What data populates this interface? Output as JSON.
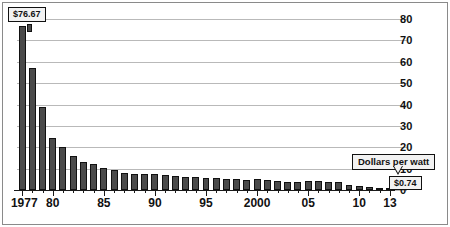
{
  "chart_data": {
    "type": "bar",
    "title": "",
    "subtitle": "",
    "xlabel": "",
    "ylabel": "",
    "ylim": [
      0,
      80
    ],
    "yticks": [
      0,
      10,
      20,
      30,
      40,
      50,
      60,
      70,
      80
    ],
    "ytick_labels": [
      "0",
      "10",
      "20",
      "30",
      "40",
      "50",
      "60",
      "70",
      "80"
    ],
    "grid": true,
    "legend": "none",
    "xtick_labels": [
      "1977",
      "80",
      "85",
      "90",
      "95",
      "2000",
      "05",
      "10",
      "13"
    ],
    "xtick_years": [
      1977,
      1980,
      1985,
      1990,
      1995,
      2000,
      2005,
      2010,
      2013
    ],
    "categories": [
      "1977",
      "1978",
      "1979",
      "1980",
      "1981",
      "1982",
      "1983",
      "1984",
      "1985",
      "1986",
      "1987",
      "1988",
      "1989",
      "1990",
      "1991",
      "1992",
      "1993",
      "1994",
      "1995",
      "1996",
      "1997",
      "1998",
      "1999",
      "2000",
      "2001",
      "2002",
      "2003",
      "2004",
      "2005",
      "2006",
      "2007",
      "2008",
      "2009",
      "2010",
      "2011",
      "2012",
      "2013"
    ],
    "values": [
      76.67,
      57.3,
      39.0,
      24.5,
      20.2,
      16.0,
      13.0,
      12.3,
      10.4,
      9.3,
      8.1,
      7.6,
      7.4,
      7.3,
      7.2,
      6.6,
      6.1,
      6.0,
      5.8,
      5.6,
      5.3,
      5.1,
      4.6,
      5.0,
      4.9,
      4.3,
      3.8,
      3.9,
      4.1,
      4.2,
      3.8,
      3.6,
      2.2,
      1.8,
      1.3,
      0.9,
      0.74
    ],
    "annotations": [
      {
        "name": "max-value-callout",
        "label": "$76.67",
        "category": "1977",
        "value": 76.67
      },
      {
        "name": "series-callout",
        "label": "Dollars per watt"
      },
      {
        "name": "min-value-callout",
        "label": "$0.74",
        "category": "2013",
        "value": 0.74
      }
    ],
    "colors": {
      "bar_fill": "#4a4a4a",
      "bar_stroke": "#111111",
      "gridline": "#b9b9b9",
      "axis": "#1a1a1a",
      "callout_bg": "#f2f2f2",
      "text": "#111111",
      "background": "#ffffff",
      "frame": "#8a8a8a"
    }
  }
}
